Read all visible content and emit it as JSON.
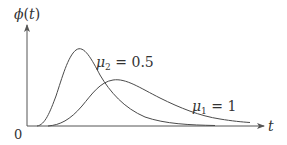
{
  "diagram": {
    "y_axis_label": {
      "func": "ϕ",
      "open": "(",
      "var": "t",
      "close": ")"
    },
    "x_axis_label": "t",
    "origin_label": "0",
    "curves": [
      {
        "name": "mu2",
        "symbol": "μ",
        "subscript": "2",
        "equals": " = ",
        "value": "0.5",
        "description": "sharper, earlier peak"
      },
      {
        "name": "mu1",
        "symbol": "μ",
        "subscript": "1",
        "equals": " = ",
        "value": "1",
        "description": "broader, later peak"
      }
    ],
    "colors": {
      "axis": "#555555",
      "curve": "#4a4a4a",
      "text": "#333333"
    }
  }
}
